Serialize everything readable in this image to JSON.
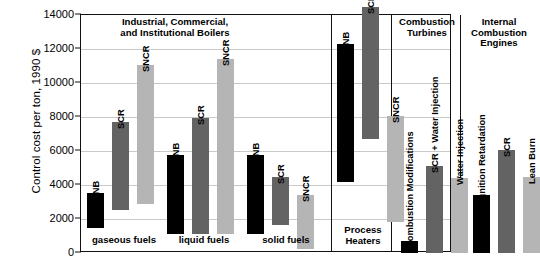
{
  "chart_data": {
    "type": "bar",
    "title": "",
    "xlabel": "",
    "ylabel": "Control cost per ton, 1990 $",
    "ylim": [
      0,
      14000
    ],
    "ytick_values": [
      0,
      2000,
      4000,
      6000,
      8000,
      10000,
      12000,
      14000
    ],
    "ytick_labels": [
      "0",
      "2000",
      "4000",
      "6000",
      "8000",
      "10000",
      "12000",
      "14000"
    ],
    "grid": true,
    "legend": "none",
    "note": "Floating/range bars: each bar spans a low-to-high cost range.",
    "groups": [
      {
        "name": "Industrial, Commercial,\nand Institutional Boilers",
        "header_span": true,
        "subgroups": [
          {
            "name": "gaseous fuels",
            "bars": [
              {
                "label": "LNB",
                "color": "black",
                "hex": "#000000",
                "low": 1460,
                "high": 3530
              },
              {
                "label": "SCR",
                "color": "dark-gray",
                "hex": "#636363",
                "low": 2555,
                "high": 7730
              },
              {
                "label": "SNCR",
                "color": "light-gray",
                "hex": "#b5b5b5",
                "low": 2860,
                "high": 11075
              }
            ]
          },
          {
            "name": "liquid fuels",
            "bars": [
              {
                "label": "LNB",
                "color": "black",
                "hex": "#000000",
                "low": 1095,
                "high": 5780
              },
              {
                "label": "SCR",
                "color": "dark-gray",
                "hex": "#636363",
                "low": 1095,
                "high": 7920
              },
              {
                "label": "SNCR",
                "color": "light-gray",
                "hex": "#b5b5b5",
                "low": 1095,
                "high": 11390
              }
            ]
          },
          {
            "name": "solid fuels",
            "bars": [
              {
                "label": "LNB",
                "color": "black",
                "hex": "#000000",
                "low": 1095,
                "high": 5780
              },
              {
                "label": "SCR",
                "color": "dark-gray",
                "hex": "#636363",
                "low": 1640,
                "high": 4500
              },
              {
                "label": "SNCR",
                "color": "light-gray",
                "hex": "#b5b5b5",
                "low": 240,
                "high": 3400
              }
            ]
          }
        ]
      },
      {
        "name": "Process\nHeaters",
        "footer": "Process\nHeaters",
        "subgroups": [
          {
            "name": "",
            "bars": [
              {
                "label": "LNB",
                "color": "black",
                "hex": "#000000",
                "low": 4200,
                "high": 12300
              },
              {
                "label": "SCR",
                "color": "dark-gray",
                "hex": "#636363",
                "low": 6700,
                "high": 14490
              },
              {
                "label": "SNCR",
                "color": "light-gray",
                "hex": "#b5b5b5",
                "low": 1825,
                "high": 8030
              }
            ]
          }
        ]
      },
      {
        "name": "Combustion\nTurbines",
        "subgroups": [
          {
            "name": "",
            "bars": [
              {
                "label": "Combustion Modifications",
                "color": "black",
                "hex": "#000000",
                "low": 0,
                "high": 730
              },
              {
                "label": "SCR + Water Injection",
                "color": "dark-gray",
                "hex": "#636363",
                "low": 0,
                "high": 5120
              },
              {
                "label": "Water Injection",
                "color": "light-gray",
                "hex": "#b5b5b5",
                "low": 0,
                "high": 4440
              }
            ]
          }
        ]
      },
      {
        "name": "Internal\nCombustion\nEngines",
        "subgroups": [
          {
            "name": "",
            "bars": [
              {
                "label": "Ignition Retardation",
                "color": "black",
                "hex": "#000000",
                "low": 0,
                "high": 3410
              },
              {
                "label": "SCR",
                "color": "dark-gray",
                "hex": "#636363",
                "low": 0,
                "high": 6085
              },
              {
                "label": "Lean Burn",
                "color": "light-gray",
                "hex": "#b5b5b5",
                "low": 0,
                "high": 4500
              }
            ]
          }
        ]
      }
    ]
  },
  "axis": {
    "y_title": "Control cost per ton, 1990 $"
  },
  "headers": {
    "boilers": "Industrial, Commercial,\nand Institutional Boilers",
    "process_heaters": "Process\nHeaters",
    "turbines": "Combustion\nTurbines",
    "ic_engines": "Internal\nCombustion\nEngines"
  },
  "footers": {
    "gaseous": "gaseous fuels",
    "liquid": "liquid fuels",
    "solid": "solid fuels",
    "process_heaters": "Process\nHeaters"
  },
  "colors": {
    "black": "#000000",
    "dark_gray": "#636363",
    "light_gray": "#b5b5b5",
    "grid": "#c9c9c9",
    "axis": "#111111"
  }
}
